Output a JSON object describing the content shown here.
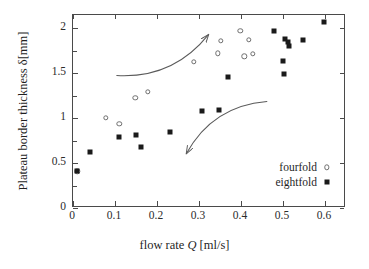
{
  "chart_data": {
    "type": "scatter",
    "title": "",
    "xlabel": "flow rate Q [ml/s]",
    "xlabel_parts": {
      "pre": "flow rate ",
      "italic": "Q",
      "post": " [ml/s]"
    },
    "ylabel": "Plateau border thickness δ[mm]",
    "xlim": [
      0,
      0.65
    ],
    "ylim": [
      0,
      2.15
    ],
    "xticks": [
      0,
      0.1,
      0.2,
      0.3,
      0.4,
      0.5,
      0.6
    ],
    "xticklabels": [
      "0",
      "0.1",
      "0.2",
      "0.3",
      "0.4",
      "0.5",
      "0.6"
    ],
    "yticks": [
      0,
      0.5,
      1,
      1.5,
      2
    ],
    "yticklabels": [
      "0",
      "0.5",
      "1",
      "1.5",
      "2"
    ],
    "grid": false,
    "legend_position": "lower right",
    "series": [
      {
        "name": "fourfold",
        "marker": "open-circle",
        "color": "#6e6e6e",
        "points": [
          [
            0.01,
            0.41
          ],
          [
            0.078,
            1.005
          ],
          [
            0.11,
            0.935
          ],
          [
            0.148,
            1.228
          ],
          [
            0.178,
            1.292
          ],
          [
            0.288,
            1.63
          ],
          [
            0.345,
            1.722
          ],
          [
            0.352,
            1.862
          ],
          [
            0.398,
            1.972
          ],
          [
            0.408,
            1.69
          ],
          [
            0.418,
            1.875
          ],
          [
            0.428,
            1.715
          ]
        ]
      },
      {
        "name": "eightfold",
        "marker": "filled-square",
        "color": "#1a1a1a",
        "points": [
          [
            0.01,
            0.408
          ],
          [
            0.04,
            0.628
          ],
          [
            0.11,
            0.788
          ],
          [
            0.15,
            0.818
          ],
          [
            0.163,
            0.678
          ],
          [
            0.23,
            0.845
          ],
          [
            0.308,
            1.082
          ],
          [
            0.348,
            1.092
          ],
          [
            0.368,
            1.455
          ],
          [
            0.478,
            1.972
          ],
          [
            0.5,
            1.64
          ],
          [
            0.505,
            1.878
          ],
          [
            0.512,
            1.848
          ],
          [
            0.515,
            1.8
          ],
          [
            0.502,
            1.498
          ],
          [
            0.548,
            1.868
          ],
          [
            0.598,
            2.075
          ]
        ]
      }
    ],
    "annotations": [
      {
        "name": "increasing-flow-arrow",
        "direction": "up-right",
        "start": [
          0.105,
          1.47
        ],
        "end": [
          0.325,
          1.93
        ]
      },
      {
        "name": "decreasing-flow-arrow",
        "direction": "down-left",
        "start": [
          0.465,
          1.18
        ],
        "end": [
          0.272,
          0.595
        ]
      }
    ]
  },
  "legend": {
    "items": [
      {
        "label": "fourfold",
        "marker": "open-circle"
      },
      {
        "label": "eightfold",
        "marker": "filled-square"
      }
    ]
  }
}
